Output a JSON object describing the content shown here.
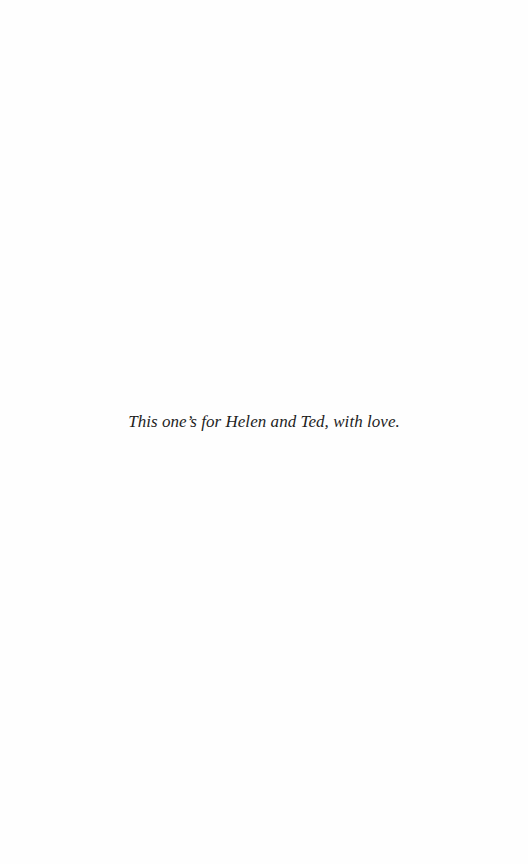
{
  "page": {
    "type": "dedication",
    "background": "#fefefe",
    "text_color": "#1e1e1e"
  },
  "dedication": {
    "text": "This one’s for Helen and Ted, with love."
  }
}
